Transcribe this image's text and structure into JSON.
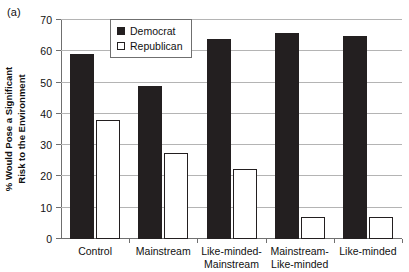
{
  "panel": {
    "label": "(a)"
  },
  "chart_data": {
    "type": "bar",
    "title": "",
    "subtitle": "",
    "xlabel": "",
    "ylabel": "% Would Pose a Significant Risk to the Environment",
    "ylabel_lines": [
      "% Would Pose a Significant",
      "Risk to the Environment"
    ],
    "categories": [
      "Control",
      "Mainstream",
      "Like-minded-Mainstream",
      "Mainstream-Like-minded",
      "Like-minded"
    ],
    "category_label_lines": [
      [
        "Control"
      ],
      [
        "Mainstream"
      ],
      [
        "Like-minded-",
        "Mainstream"
      ],
      [
        "Mainstream-",
        "Like-minded"
      ],
      [
        "Like-minded"
      ]
    ],
    "series": [
      {
        "name": "Democrat",
        "color": "#231f20",
        "fill": "solid",
        "values": [
          59,
          49,
          64,
          66,
          65
        ]
      },
      {
        "name": "Republican",
        "color": "#ffffff",
        "fill": "open",
        "values": [
          38,
          27.5,
          22.5,
          7,
          7
        ]
      }
    ],
    "ylim": [
      0,
      70
    ],
    "yticks": [
      0,
      10,
      20,
      30,
      40,
      50,
      60,
      70
    ],
    "ytick_labels": [
      "0",
      "10",
      "20",
      "30",
      "40",
      "50",
      "60",
      "70"
    ],
    "grid": {
      "horizontal": true,
      "vertical": false
    },
    "legend": {
      "position": "upper-center-left-inside",
      "entries": [
        "Democrat",
        "Republican"
      ]
    }
  }
}
